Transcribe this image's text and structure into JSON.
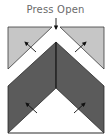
{
  "diagram": {
    "title": "Press Open",
    "colors": {
      "light_panel": "#c6c6c6",
      "dark_panel": "#5b5b5b",
      "outline": "#2a2a2a",
      "arrow": "#111111",
      "text": "#6a6a6a",
      "background": "#ffffff"
    },
    "panels": [
      {
        "name": "top-left-flap",
        "shade": "light"
      },
      {
        "name": "top-right-flap",
        "shade": "light"
      },
      {
        "name": "bottom-left-flap",
        "shade": "dark"
      },
      {
        "name": "bottom-right-flap",
        "shade": "dark"
      }
    ],
    "arrows": [
      {
        "location": "top-center",
        "direction": "down"
      },
      {
        "location": "top-left-flap",
        "direction": "up-left"
      },
      {
        "location": "top-right-flap",
        "direction": "up-right"
      },
      {
        "location": "bottom-left-flap",
        "direction": "up-left"
      },
      {
        "location": "bottom-right-flap",
        "direction": "up-right"
      }
    ]
  }
}
